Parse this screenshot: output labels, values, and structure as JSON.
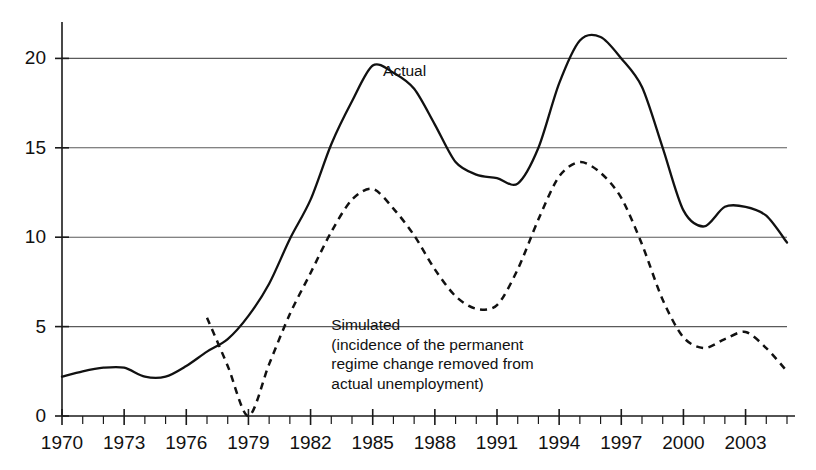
{
  "chart_data": {
    "type": "line",
    "title": "",
    "subtitle": "",
    "xlabel": "",
    "ylabel": "",
    "xlim": [
      1970,
      2005
    ],
    "ylim": [
      0,
      22
    ],
    "y_ticks": [
      0,
      5,
      10,
      15,
      20
    ],
    "y_tick_labels": [
      "0",
      "5",
      "10",
      "15",
      "20"
    ],
    "x_tick_labels": [
      "1970",
      "1973",
      "1976",
      "1979",
      "1982",
      "1985",
      "1988",
      "1991",
      "1994",
      "1997",
      "2000",
      "2003"
    ],
    "x_tick_values": [
      1970,
      1973,
      1976,
      1979,
      1982,
      1985,
      1988,
      1991,
      1994,
      1997,
      2000,
      2003
    ],
    "x_minor_step": 1,
    "grid": "horizontal",
    "legend_position": "inline-annotations",
    "series": [
      {
        "name": "Actual",
        "style": "solid",
        "color": "#111111",
        "x": [
          1970,
          1971,
          1972,
          1973,
          1974,
          1975,
          1976,
          1977,
          1978,
          1979,
          1980,
          1981,
          1982,
          1983,
          1984,
          1985,
          1986,
          1987,
          1988,
          1989,
          1990,
          1991,
          1992,
          1993,
          1994,
          1995,
          1996,
          1997,
          1998,
          1999,
          2000,
          2001,
          2002,
          2003,
          2004,
          2005
        ],
        "y": [
          2.2,
          2.5,
          2.7,
          2.7,
          2.2,
          2.2,
          2.8,
          3.6,
          4.3,
          5.6,
          7.4,
          9.9,
          12.1,
          15.2,
          17.6,
          19.6,
          19.2,
          18.3,
          16.3,
          14.2,
          13.5,
          13.3,
          13.0,
          15.0,
          18.6,
          21.0,
          21.2,
          20.0,
          18.4,
          15.0,
          11.5,
          10.6,
          11.7,
          11.7,
          11.2,
          9.7
        ]
      },
      {
        "name": "Simulated",
        "style": "dashed",
        "color": "#111111",
        "x": [
          1977,
          1978,
          1979,
          1980,
          1981,
          1982,
          1983,
          1984,
          1985,
          1986,
          1987,
          1988,
          1989,
          1990,
          1991,
          1992,
          1993,
          1994,
          1995,
          1996,
          1997,
          1998,
          1999,
          2000,
          2001,
          2002,
          2003,
          2004,
          2005
        ],
        "y": [
          5.5,
          2.8,
          0.0,
          2.9,
          5.7,
          8.0,
          10.3,
          12.1,
          12.7,
          11.6,
          10.1,
          8.2,
          6.7,
          6.0,
          6.2,
          8.2,
          11.0,
          13.4,
          14.2,
          13.6,
          12.2,
          9.6,
          6.5,
          4.4,
          3.8,
          4.3,
          4.7,
          3.8,
          2.5
        ]
      }
    ],
    "annotations": [
      {
        "name": "actual-label",
        "text": "Actual",
        "x": 1985.5,
        "y": 19.0
      },
      {
        "name": "simulated-label",
        "lines": [
          "Simulated",
          "(incidence of the permanent",
          "regime change removed from",
          "actual unemployment)"
        ],
        "x": 1983.0,
        "y": 4.8
      }
    ],
    "colors": {
      "ink": "#111111",
      "grid": "#5a5a5a",
      "background": "#ffffff"
    }
  }
}
